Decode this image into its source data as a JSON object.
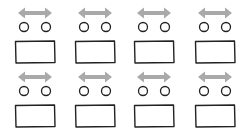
{
  "diagram": {
    "rows": 2,
    "columns": 4,
    "colors": {
      "arrow": "#a9a9a9",
      "stroke": "#222222",
      "background": "#ffffff"
    },
    "units": [
      {
        "id": "unit-1",
        "row": 1,
        "col": 1,
        "x": 14,
        "y": 6
      },
      {
        "id": "unit-2",
        "row": 1,
        "col": 2,
        "x": 74,
        "y": 6
      },
      {
        "id": "unit-3",
        "row": 1,
        "col": 3,
        "x": 133,
        "y": 6
      },
      {
        "id": "unit-4",
        "row": 1,
        "col": 4,
        "x": 194,
        "y": 6
      },
      {
        "id": "unit-5",
        "row": 2,
        "col": 1,
        "x": 14,
        "y": 70
      },
      {
        "id": "unit-6",
        "row": 2,
        "col": 2,
        "x": 74,
        "y": 70
      },
      {
        "id": "unit-7",
        "row": 2,
        "col": 3,
        "x": 133,
        "y": 70
      },
      {
        "id": "unit-8",
        "row": 2,
        "col": 4,
        "x": 194,
        "y": 70
      }
    ]
  }
}
